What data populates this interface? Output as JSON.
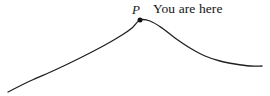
{
  "figure": {
    "background_color": "#ffffff",
    "stroke_color": "#1f1f24",
    "point_color": "#141414",
    "point_label": "P",
    "annotation": "You are here"
  },
  "chart_data": {
    "type": "line",
    "title": "",
    "xlabel": "",
    "ylabel": "",
    "xlim": [
      0,
      270
    ],
    "ylim": [
      96,
      0
    ],
    "grid": false,
    "legend": false,
    "series": [
      {
        "name": "curve",
        "description": "smooth hill-shaped curve rising from lower left to a local maximum then descending and flattening to the right",
        "x": [
          8,
          30,
          55,
          80,
          105,
          122,
          132,
          140,
          150,
          162,
          175,
          190,
          205,
          220,
          235,
          250,
          262
        ],
        "y": [
          92,
          81,
          70,
          58,
          45,
          35,
          28,
          20,
          21,
          28,
          38,
          48,
          56,
          61,
          64,
          66,
          66
        ]
      }
    ],
    "annotations": [
      {
        "name": "point-P",
        "label": "P",
        "text": "You are here",
        "x": 140,
        "y": 20,
        "marker": "filled-circle",
        "marker_size": 5
      }
    ]
  }
}
